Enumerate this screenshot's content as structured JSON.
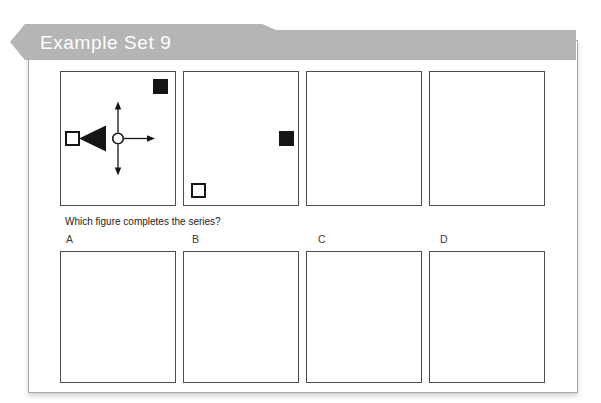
{
  "banner": {
    "title": "Example Set 9"
  },
  "question": {
    "text": "Which figure completes the series?"
  },
  "colors": {
    "banner_bg": "#b5b5b5",
    "banner_text": "#ffffff",
    "card_border": "#a9a9a9",
    "panel_border": "#4d4d4d",
    "shape_black": "#151515"
  },
  "series": [
    {
      "name": "series-figure-1",
      "triangle": {
        "position": "left",
        "direction": "left"
      },
      "arrows": [
        "up",
        "down",
        "right"
      ],
      "squares": [
        {
          "style": "filled",
          "position": "top-right"
        },
        {
          "style": "open",
          "position": "middle-left"
        }
      ]
    },
    {
      "name": "series-figure-2",
      "triangle": {
        "position": "top",
        "direction": "down"
      },
      "arrows": [
        "left",
        "right",
        "down"
      ],
      "squares": [
        {
          "style": "filled",
          "position": "middle-right"
        },
        {
          "style": "open",
          "position": "bottom-left"
        }
      ]
    },
    {
      "name": "series-figure-3",
      "triangle": {
        "position": "right",
        "direction": "right"
      },
      "arrows": [
        "up",
        "down",
        "left"
      ],
      "squares": [
        {
          "style": "open",
          "position": "top-left"
        },
        {
          "style": "filled",
          "position": "bottom-right"
        }
      ]
    },
    {
      "name": "series-figure-4",
      "triangle": {
        "position": "bottom",
        "direction": "up"
      },
      "arrows": [
        "up",
        "left",
        "right"
      ],
      "squares": [
        {
          "style": "filled",
          "position": "top-right"
        },
        {
          "style": "open",
          "position": "middle-left"
        }
      ]
    }
  ],
  "options": [
    {
      "label": "A",
      "figure": {
        "triangle": {
          "position": "top",
          "direction": "down"
        },
        "arrows": [
          "left",
          "right",
          "down"
        ],
        "squares": [
          {
            "style": "filled",
            "position": "top-right"
          },
          {
            "style": "open",
            "position": "bottom-left"
          }
        ]
      }
    },
    {
      "label": "B",
      "figure": {
        "triangle": {
          "position": "left",
          "direction": "left"
        },
        "arrows": [
          "up",
          "down",
          "right"
        ],
        "squares": [
          {
            "style": "open",
            "position": "top-left"
          },
          {
            "style": "filled",
            "position": "middle-right"
          }
        ]
      }
    },
    {
      "label": "C",
      "figure": {
        "triangle": {
          "position": "left",
          "direction": "left"
        },
        "arrows": [
          "up",
          "down",
          "right"
        ],
        "squares": [
          {
            "style": "filled",
            "position": "middle-right"
          },
          {
            "style": "open",
            "position": "bottom-left"
          }
        ]
      }
    },
    {
      "label": "D",
      "figure": {
        "triangle": {
          "position": "left",
          "direction": "right"
        },
        "arrows": [
          "up",
          "down",
          "right"
        ],
        "squares": [
          {
            "style": "open",
            "position": "bottom-left"
          },
          {
            "style": "filled",
            "position": "bottom-right"
          }
        ]
      }
    }
  ]
}
